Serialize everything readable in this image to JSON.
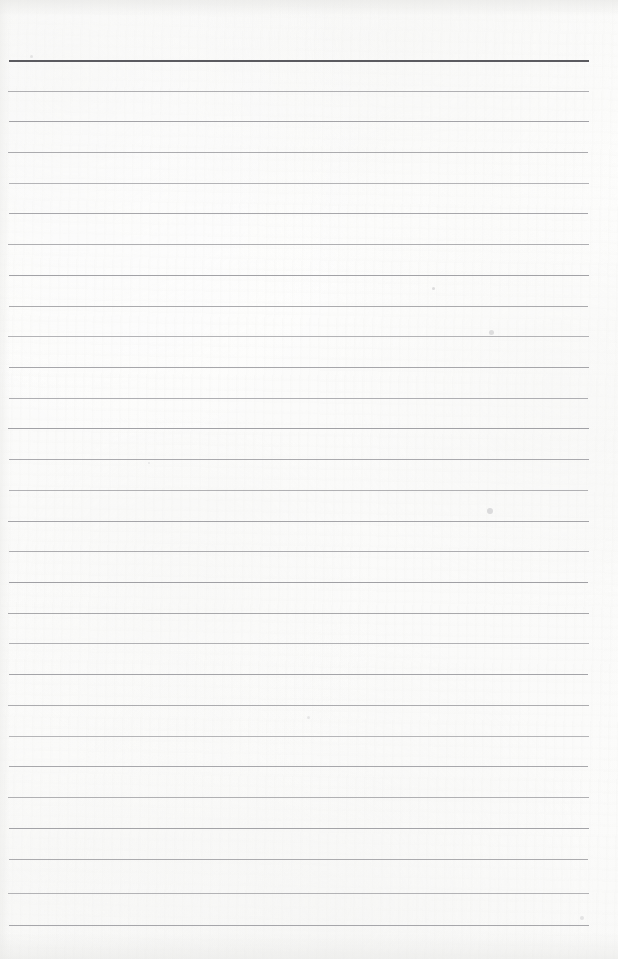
{
  "document": {
    "kind": "scanned-ruled-notepad-page",
    "title": "Blank ruled notepad page",
    "content_text": "",
    "page_width_px": 618,
    "page_height_px": 959,
    "paper_color": "#fcfcfb",
    "has_handwriting": false,
    "has_printed_text": false
  },
  "ruling": {
    "line_color": "#9a9a9e",
    "header_rule_color": "#5b5b60",
    "header_rule_thickness_px": 2,
    "body_rule_thickness_px": 1,
    "line_count": 29,
    "first_line_y_px": 60,
    "line_spacing_px": 30.8,
    "line_left_x_px": 9,
    "line_right_x_px": 589,
    "top_margin_px": 60,
    "bottom_margin_px": 34,
    "right_margin_px": 29,
    "lines": [
      {
        "index": 1,
        "y": 60,
        "left": 9,
        "right": 589,
        "emphasis": "header"
      },
      {
        "index": 2,
        "y": 91,
        "left": 8,
        "right": 589,
        "emphasis": "normal"
      },
      {
        "index": 3,
        "y": 121,
        "left": 9,
        "right": 589,
        "emphasis": "normal"
      },
      {
        "index": 4,
        "y": 152,
        "left": 8,
        "right": 588,
        "emphasis": "normal"
      },
      {
        "index": 5,
        "y": 183,
        "left": 9,
        "right": 589,
        "emphasis": "normal"
      },
      {
        "index": 6,
        "y": 213,
        "left": 9,
        "right": 588,
        "emphasis": "normal"
      },
      {
        "index": 7,
        "y": 244,
        "left": 8,
        "right": 589,
        "emphasis": "normal"
      },
      {
        "index": 8,
        "y": 275,
        "left": 9,
        "right": 589,
        "emphasis": "normal"
      },
      {
        "index": 9,
        "y": 306,
        "left": 9,
        "right": 588,
        "emphasis": "normal"
      },
      {
        "index": 10,
        "y": 336,
        "left": 8,
        "right": 589,
        "emphasis": "normal"
      },
      {
        "index": 11,
        "y": 367,
        "left": 9,
        "right": 589,
        "emphasis": "normal"
      },
      {
        "index": 12,
        "y": 398,
        "left": 9,
        "right": 588,
        "emphasis": "normal"
      },
      {
        "index": 13,
        "y": 428,
        "left": 8,
        "right": 589,
        "emphasis": "normal"
      },
      {
        "index": 14,
        "y": 459,
        "left": 9,
        "right": 589,
        "emphasis": "normal"
      },
      {
        "index": 15,
        "y": 490,
        "left": 9,
        "right": 588,
        "emphasis": "normal"
      },
      {
        "index": 16,
        "y": 521,
        "left": 8,
        "right": 589,
        "emphasis": "normal"
      },
      {
        "index": 17,
        "y": 551,
        "left": 9,
        "right": 589,
        "emphasis": "normal"
      },
      {
        "index": 18,
        "y": 582,
        "left": 9,
        "right": 588,
        "emphasis": "normal"
      },
      {
        "index": 19,
        "y": 613,
        "left": 8,
        "right": 589,
        "emphasis": "normal"
      },
      {
        "index": 20,
        "y": 643,
        "left": 9,
        "right": 589,
        "emphasis": "normal"
      },
      {
        "index": 21,
        "y": 674,
        "left": 9,
        "right": 588,
        "emphasis": "normal"
      },
      {
        "index": 22,
        "y": 705,
        "left": 8,
        "right": 589,
        "emphasis": "normal"
      },
      {
        "index": 23,
        "y": 736,
        "left": 9,
        "right": 589,
        "emphasis": "normal"
      },
      {
        "index": 24,
        "y": 766,
        "left": 9,
        "right": 588,
        "emphasis": "normal"
      },
      {
        "index": 25,
        "y": 797,
        "left": 8,
        "right": 589,
        "emphasis": "normal"
      },
      {
        "index": 26,
        "y": 828,
        "left": 9,
        "right": 589,
        "emphasis": "normal"
      },
      {
        "index": 27,
        "y": 859,
        "left": 9,
        "right": 588,
        "emphasis": "normal"
      },
      {
        "index": 28,
        "y": 893,
        "left": 8,
        "right": 589,
        "emphasis": "normal"
      },
      {
        "index": 29,
        "y": 925,
        "left": 9,
        "right": 589,
        "emphasis": "normal"
      }
    ]
  },
  "artifacts": {
    "specks": [
      {
        "x": 30,
        "y": 55,
        "size": 3,
        "opacity": 0.22
      },
      {
        "x": 432,
        "y": 287,
        "size": 3,
        "opacity": 0.3
      },
      {
        "x": 489,
        "y": 330,
        "size": 5,
        "opacity": 0.28
      },
      {
        "x": 487,
        "y": 508,
        "size": 6,
        "opacity": 0.3
      },
      {
        "x": 307,
        "y": 716,
        "size": 3,
        "opacity": 0.2
      },
      {
        "x": 580,
        "y": 916,
        "size": 4,
        "opacity": 0.22
      },
      {
        "x": 148,
        "y": 462,
        "size": 2,
        "opacity": 0.18
      }
    ]
  }
}
